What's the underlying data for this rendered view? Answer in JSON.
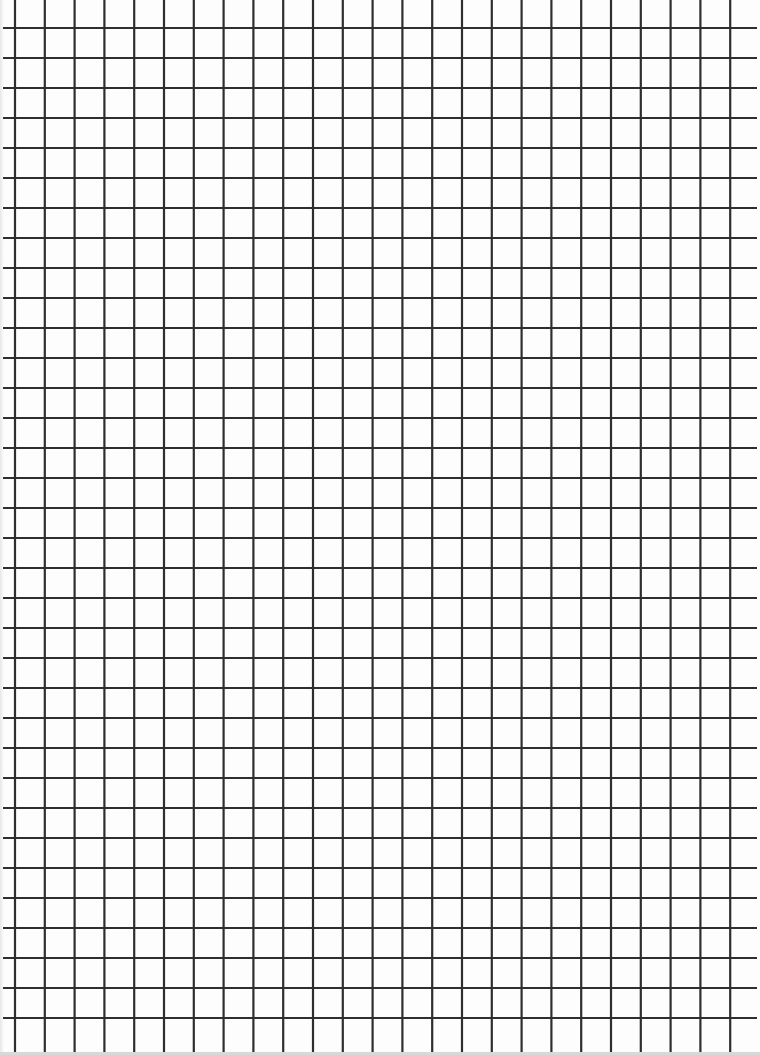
{
  "page": {
    "type": "grid-paper",
    "background_color": "#fdfdfd",
    "line_color": "#2e2e2e"
  },
  "grid": {
    "vertical": {
      "start_x": 15,
      "spacing": 29.8,
      "count": 25,
      "y_from": 0,
      "y_to": 1052
    },
    "horizontal": {
      "start_y": 28,
      "spacing": 30.0,
      "count": 34,
      "x_from": 3,
      "x_to": 757
    },
    "line_width": 2.2
  }
}
